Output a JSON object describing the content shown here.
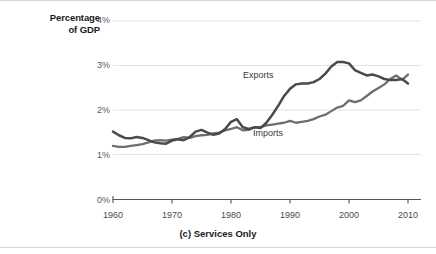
{
  "chart_data": {
    "type": "line",
    "title": "",
    "caption": "(c) Services Only",
    "ylabel_line1": "Percentage",
    "ylabel_line2": "of GDP",
    "xlabel": "",
    "grid": true,
    "legend_position": "inline-annotations",
    "xlim": [
      1960,
      2011
    ],
    "ylim": [
      0,
      4
    ],
    "ytick_labels": [
      "4%",
      "3%",
      "2%",
      "1%",
      "0%"
    ],
    "ytick_values": [
      4,
      3,
      2,
      1,
      0
    ],
    "xtick_labels": [
      "1960",
      "1970",
      "1980",
      "1990",
      "2000",
      "2010"
    ],
    "xtick_values": [
      1960,
      1970,
      1980,
      1990,
      2000,
      2010
    ],
    "colors": {
      "exports_line": "#4a4a4a",
      "imports_line": "#6e6e6e",
      "grid": "#e4e4e4",
      "axis": "#555555",
      "text": "#1a1a1a"
    },
    "series": [
      {
        "name": "Exports",
        "label": "Exports",
        "x": [
          1960,
          1961,
          1962,
          1963,
          1964,
          1965,
          1966,
          1967,
          1968,
          1969,
          1970,
          1971,
          1972,
          1973,
          1974,
          1975,
          1976,
          1977,
          1978,
          1979,
          1980,
          1981,
          1982,
          1983,
          1984,
          1985,
          1986,
          1987,
          1988,
          1989,
          1990,
          1991,
          1992,
          1993,
          1994,
          1995,
          1996,
          1997,
          1998,
          1999,
          2000,
          2001,
          2002,
          2003,
          2004,
          2005,
          2006,
          2007,
          2008,
          2009,
          2010
        ],
        "values": [
          1.52,
          1.44,
          1.38,
          1.37,
          1.4,
          1.38,
          1.33,
          1.28,
          1.26,
          1.25,
          1.32,
          1.35,
          1.33,
          1.4,
          1.52,
          1.56,
          1.5,
          1.45,
          1.48,
          1.58,
          1.74,
          1.8,
          1.62,
          1.58,
          1.62,
          1.6,
          1.72,
          1.9,
          2.1,
          2.32,
          2.48,
          2.58,
          2.6,
          2.6,
          2.63,
          2.7,
          2.82,
          2.98,
          3.08,
          3.08,
          3.05,
          2.9,
          2.84,
          2.78,
          2.8,
          2.76,
          2.7,
          2.68,
          2.68,
          2.7,
          2.6
        ]
      },
      {
        "name": "Imports",
        "label": "Imports",
        "x": [
          1960,
          1961,
          1962,
          1963,
          1964,
          1965,
          1966,
          1967,
          1968,
          1969,
          1970,
          1971,
          1972,
          1973,
          1974,
          1975,
          1976,
          1977,
          1978,
          1979,
          1980,
          1981,
          1982,
          1983,
          1984,
          1985,
          1986,
          1987,
          1988,
          1989,
          1990,
          1991,
          1992,
          1993,
          1994,
          1995,
          1996,
          1997,
          1998,
          1999,
          2000,
          2001,
          2002,
          2003,
          2004,
          2005,
          2006,
          2007,
          2008,
          2009,
          2010
        ],
        "values": [
          1.2,
          1.18,
          1.18,
          1.2,
          1.22,
          1.24,
          1.28,
          1.32,
          1.33,
          1.32,
          1.34,
          1.36,
          1.4,
          1.38,
          1.42,
          1.44,
          1.45,
          1.48,
          1.5,
          1.55,
          1.58,
          1.62,
          1.55,
          1.56,
          1.62,
          1.62,
          1.66,
          1.68,
          1.7,
          1.72,
          1.76,
          1.72,
          1.74,
          1.76,
          1.8,
          1.86,
          1.9,
          1.98,
          2.06,
          2.1,
          2.22,
          2.18,
          2.22,
          2.32,
          2.42,
          2.5,
          2.58,
          2.7,
          2.78,
          2.68,
          2.8
        ]
      }
    ],
    "annotations": [
      {
        "text": "Exports",
        "year": 1990,
        "value": 2.8
      },
      {
        "text": "Imports",
        "year": 1992,
        "value": 1.55
      }
    ]
  }
}
